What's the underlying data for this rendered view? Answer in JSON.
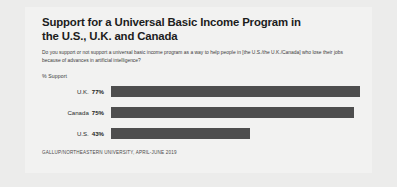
{
  "header": {
    "title": "Support for a Universal Basic Income Program in the U.S., U.K. and Canada",
    "question": "Do you support or not support a universal basic income program as a way to help people in [the U.S./the U.K./Canada] who lose their jobs because of advances in artificial intelligence?"
  },
  "footer": {
    "source": "GALLUP/NORTHEASTERN UNIVERSITY, APRIL-JUNE 2019"
  },
  "chart_data": {
    "type": "bar",
    "orientation": "horizontal",
    "title": "Support for a Universal Basic Income Program in the U.S., U.K. and Canada",
    "subtitle": "Do you support or not support a universal basic income program as a way to help people in [the U.S./the U.K./Canada] who lose their jobs because of advances in artificial intelligence?",
    "xlabel": "",
    "ylabel": "",
    "axis_note": "% Support",
    "categories": [
      "U.K.",
      "Canada",
      "U.S."
    ],
    "values": [
      77,
      75,
      43
    ],
    "value_labels": [
      "77%",
      "75%",
      "43%"
    ],
    "xlim": [
      0,
      100
    ],
    "grid": false,
    "legend": false,
    "bar_color": "#4e4e4e",
    "background_color": "#f2f2f1",
    "source": "GALLUP/NORTHEASTERN UNIVERSITY, APRIL-JUNE 2019"
  }
}
